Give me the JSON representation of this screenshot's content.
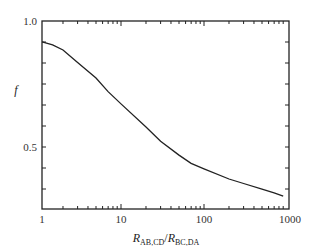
{
  "chart_data": {
    "type": "line",
    "title": "",
    "xlabel": "R_AB,CD / R_BC,DA",
    "xlabel_parts": {
      "r1": "R",
      "s1": "AB,CD",
      "slash": "/",
      "r2": "R",
      "s2": "BC,DA"
    },
    "ylabel": "f",
    "xscale": "log",
    "yscale": "linear",
    "xlim": [
      1.1,
      1000
    ],
    "ylim": [
      0.254,
      1.0
    ],
    "grid": false,
    "legend": null,
    "x_ticks": [
      "1",
      "10",
      "100",
      "1000"
    ],
    "y_ticks": [
      "1.0",
      "0.5"
    ],
    "series": [
      {
        "name": "f",
        "color": "#222222",
        "x": [
          1.12,
          1.5,
          2,
          3,
          5,
          7,
          10,
          20,
          30,
          50,
          70,
          100,
          200,
          300,
          500,
          700,
          900
        ],
        "y": [
          0.917,
          0.905,
          0.885,
          0.835,
          0.774,
          0.72,
          0.671,
          0.579,
          0.523,
          0.468,
          0.435,
          0.413,
          0.373,
          0.355,
          0.333,
          0.318,
          0.305
        ]
      }
    ]
  }
}
